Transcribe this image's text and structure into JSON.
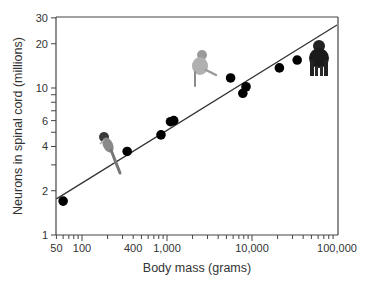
{
  "chart_data": {
    "type": "scatter",
    "title": "",
    "xlabel": "Body mass (grams)",
    "ylabel": "Neurons in spinal cord (millions)",
    "xscale": "log",
    "yscale": "log",
    "xlim": [
      50,
      100000
    ],
    "ylim": [
      1,
      30
    ],
    "grid": false,
    "legend": null,
    "x_tick_labels": [
      "50",
      "100",
      "400",
      "1,000",
      "10,000",
      "100,000"
    ],
    "x_tick_values": [
      50,
      100,
      400,
      1000,
      10000,
      100000
    ],
    "y_tick_labels": [
      "1",
      "2",
      "4",
      "6",
      "10",
      "20",
      "30"
    ],
    "y_tick_values": [
      1,
      2,
      4,
      6,
      10,
      20,
      30
    ],
    "series": [
      {
        "name": "Primate species",
        "x": [
          60,
          340,
          850,
          1100,
          1200,
          5600,
          7800,
          8500,
          21000,
          34000
        ],
        "y": [
          1.7,
          3.7,
          4.8,
          5.9,
          6.0,
          11.7,
          9.2,
          10.2,
          13.7,
          15.5
        ]
      }
    ],
    "fit_line": {
      "name": "Power-law fit",
      "x": [
        50,
        100000
      ],
      "y": [
        1.76,
        26.8
      ]
    },
    "annotations": [
      {
        "type": "image",
        "label": "tarsier-like small primate",
        "x": 180,
        "y": 3.5
      },
      {
        "type": "image",
        "label": "monkey",
        "x": 3000,
        "y": 12
      },
      {
        "type": "image",
        "label": "chimpanzee",
        "x": 60000,
        "y": 15
      }
    ]
  }
}
